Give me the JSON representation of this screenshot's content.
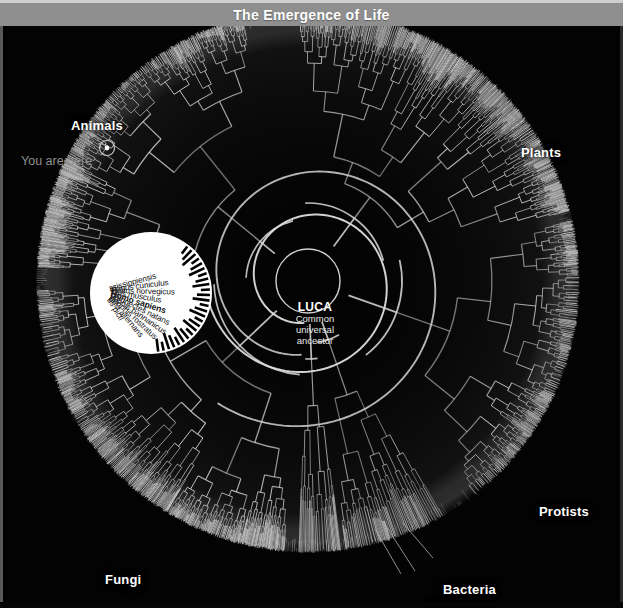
{
  "window": {
    "title": "The Emergence of Life"
  },
  "chart_data": {
    "type": "tree",
    "subtype": "radial-dendrogram",
    "title": "The Emergence of Life",
    "root": {
      "name": "LUCA",
      "description": "Common universal ancestor"
    },
    "clade_labels": [
      {
        "name": "Animals",
        "angle_deg": 205,
        "x": 68,
        "y": 92
      },
      {
        "name": "Plants",
        "angle_deg": 330,
        "x": 518,
        "y": 119
      },
      {
        "name": "Protists",
        "angle_deg": 30,
        "x": 536,
        "y": 478
      },
      {
        "name": "Fungi",
        "angle_deg": 125,
        "x": 102,
        "y": 546
      },
      {
        "name": "Bacteria",
        "angle_deg": 70,
        "x": 440,
        "y": 556
      },
      {
        "name": "Archaea",
        "angle_deg": 78,
        "x": 425,
        "y": 573
      }
    ],
    "annotation": {
      "you_are_here": "You are here",
      "marker_x": 107,
      "marker_y": 148
    },
    "magnified_species": [
      {
        "label": "ssissippiensis",
        "bold": false
      },
      {
        "label": "olagus cuniculus",
        "bold": false
      },
      {
        "label": "Rattus norvegicus",
        "bold": false
      },
      {
        "label": "Mus musculus",
        "bold": false
      },
      {
        "label": "Homo sapiens",
        "bold": true
      },
      {
        "label": "phionectes natans",
        "bold": false
      },
      {
        "label": "yophis bannanicus",
        "bold": false
      },
      {
        "label": "geophis rostratus",
        "bold": false
      },
      {
        "label": "onia alternans",
        "bold": false
      },
      {
        "label": "us picti",
        "bold": false
      }
    ],
    "colors": {
      "background": "#030303",
      "branches": "#d8d8d8",
      "title_bar": "#8f8f8f",
      "label_text": "#ffffff",
      "annotation_text": "#8f8f8f",
      "magnifier_fill": "#ffffff",
      "magnifier_text": "#111111"
    },
    "layout": {
      "center_x": 308,
      "center_y": 281,
      "inner_radius": 42,
      "outer_radius": 268,
      "tip_count": 760,
      "description": "Circular dendrogram of the tree of life radiating from LUCA at center, with a spiral-shaped root and densely packed leaf tips at the perimeter."
    }
  }
}
